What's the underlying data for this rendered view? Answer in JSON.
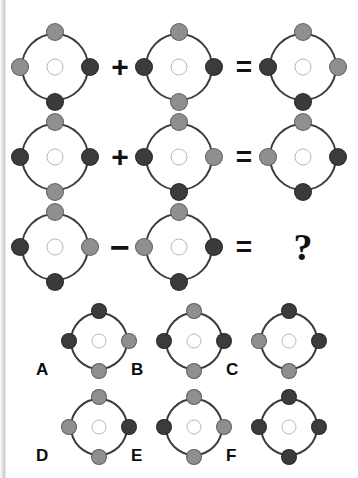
{
  "puzzle": {
    "type": "visual-analogy",
    "colors": {
      "light": "#8f8f8f",
      "dark": "#3b3b3b",
      "ring": "#3c3c3c",
      "hub": "#ffffff",
      "ink": "#111111"
    },
    "node_positions": [
      "top",
      "right",
      "bottom",
      "left"
    ],
    "equations": [
      {
        "id": "row-1",
        "operator": "+",
        "equals": "=",
        "operand_a": {
          "top": "light",
          "right": "dark",
          "bottom": "dark",
          "left": "light"
        },
        "operand_b": {
          "top": "light",
          "right": "dark",
          "bottom": "light",
          "left": "dark"
        },
        "result": {
          "top": "light",
          "right": "light",
          "bottom": "dark",
          "left": "dark"
        }
      },
      {
        "id": "row-2",
        "operator": "+",
        "equals": "=",
        "operand_a": {
          "top": "light",
          "right": "dark",
          "bottom": "light",
          "left": "dark"
        },
        "operand_b": {
          "top": "light",
          "right": "light",
          "bottom": "dark",
          "left": "dark"
        },
        "result": {
          "top": "light",
          "right": "dark",
          "bottom": "dark",
          "left": "light"
        }
      },
      {
        "id": "row-3",
        "operator": "−",
        "equals": "=",
        "operand_a": {
          "top": "light",
          "right": "light",
          "bottom": "dark",
          "left": "dark"
        },
        "operand_b": {
          "top": "light",
          "right": "dark",
          "bottom": "dark",
          "left": "light"
        },
        "result": "?"
      }
    ],
    "unknown_marker": "?",
    "options": [
      {
        "label": "A",
        "top": "dark",
        "right": "light",
        "bottom": "light",
        "left": "dark"
      },
      {
        "label": "B",
        "top": "light",
        "right": "dark",
        "bottom": "light",
        "left": "dark"
      },
      {
        "label": "C",
        "top": "dark",
        "right": "dark",
        "bottom": "light",
        "left": "light"
      },
      {
        "label": "D",
        "top": "light",
        "right": "dark",
        "bottom": "light",
        "left": "light"
      },
      {
        "label": "E",
        "top": "light",
        "right": "light",
        "bottom": "light",
        "left": "dark"
      },
      {
        "label": "F",
        "top": "dark",
        "right": "dark",
        "bottom": "dark",
        "left": "dark"
      }
    ]
  }
}
